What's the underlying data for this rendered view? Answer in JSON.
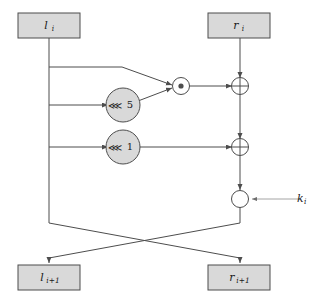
{
  "diagram": {
    "colors": {
      "box_fill": "#d9d9d9",
      "node_fill": "#d9d9d9",
      "stroke": "#4d4d4d",
      "op_fill": "#ffffff",
      "text": "#1a1a1a",
      "faint_wire": "#9a9a9a"
    },
    "registers": {
      "left_in": {
        "base": "l",
        "sub": "i",
        "label": "l",
        "subscript": "i"
      },
      "right_in": {
        "base": "r",
        "sub": "i",
        "label": "r",
        "subscript": "i"
      },
      "left_out": {
        "base": "l",
        "sub": "i+1",
        "label": "l",
        "subscript": "i+1"
      },
      "right_out": {
        "base": "r",
        "sub": "i+1",
        "label": "r",
        "subscript": "i+1"
      }
    },
    "nodes": {
      "rotate_5": {
        "op": "⋘",
        "amount": "5",
        "name": "rotate-left-5"
      },
      "rotate_1": {
        "op": "⋘",
        "amount": "1",
        "name": "rotate-left-1"
      },
      "multiply": {
        "symbol": "⊙",
        "name": "modular-multiply"
      },
      "xor_top": {
        "symbol": "⊕",
        "name": "xor-top"
      },
      "xor_middle": {
        "symbol": "⊕",
        "name": "xor-middle"
      },
      "add_key": {
        "symbol": "",
        "name": "key-mix"
      }
    },
    "key_input": {
      "base": "k",
      "sub": "i",
      "label": "k",
      "subscript": "i"
    }
  }
}
